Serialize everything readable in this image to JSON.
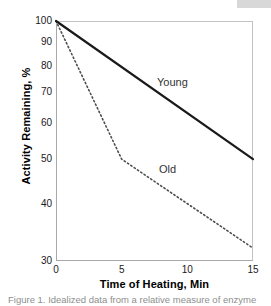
{
  "figure": {
    "caption_fragment": "Figure 1.  Idealized data from a relative measure of enzyme"
  },
  "chart_data": {
    "type": "line",
    "title": "",
    "xlabel": "Time of Heating, Min",
    "ylabel": "Activity Remaining, %",
    "xlim": [
      0,
      15
    ],
    "ylim": [
      30,
      100
    ],
    "yscale": "log",
    "xscale": "linear",
    "grid": false,
    "legend_position": "inline-annotations",
    "xticks": [
      0,
      5,
      10,
      15
    ],
    "xtick_labels": [
      "0",
      "5",
      "10",
      "15"
    ],
    "yticks": [
      30,
      40,
      50,
      60,
      70,
      80,
      90,
      100
    ],
    "ytick_labels": [
      "30",
      "40",
      "50",
      "60",
      "70",
      "80",
      "90",
      "100"
    ],
    "series": [
      {
        "name": "Young",
        "style": "solid",
        "color": "#1a1a1a",
        "width": 2.2,
        "label_text": "Young",
        "x": [
          0,
          15
        ],
        "values": [
          100,
          50
        ]
      },
      {
        "name": "Old",
        "style": "dotted",
        "color": "#4d4d4d",
        "width": 1.6,
        "label_text": "Old",
        "x": [
          0,
          5,
          15
        ],
        "values": [
          100,
          50,
          32
        ]
      }
    ]
  },
  "colors": {
    "axis": "#a9a9a9",
    "text": "#1a1a1a",
    "young": "#1a1a1a",
    "old": "#4d4d4d",
    "background": "#ffffff"
  }
}
